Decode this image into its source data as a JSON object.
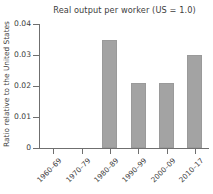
{
  "chart_data": {
    "type": "bar",
    "title": "Real output per worker (US = 1.0)",
    "xlabel": "",
    "ylabel": "Ratio relative to the United States",
    "categories": [
      "1960–69",
      "1970–79",
      "1980–89",
      "1990–99",
      "2000–09",
      "2010–17"
    ],
    "values": [
      0,
      0,
      0.035,
      0.021,
      0.021,
      0.03
    ],
    "ylim": [
      0,
      0.04
    ],
    "yticks": [
      0,
      0.01,
      0.02,
      0.03,
      0.04
    ],
    "ytick_labels": [
      "0",
      "0.01",
      "0.02",
      "0.03",
      "0.04"
    ],
    "grid": false,
    "legend": false,
    "bar_color": "#a3a3a3",
    "axis_color": "#6f6f6f",
    "text_color": "#3d3d3d",
    "background": "#ffffff"
  }
}
